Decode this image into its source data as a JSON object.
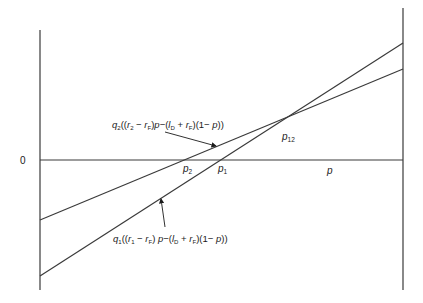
{
  "diagram": {
    "type": "line-diagram",
    "axes": {
      "origin_label": "0",
      "x_label": "p"
    },
    "lines": [
      {
        "id": "q2",
        "label": {
          "coef": "q",
          "coef_sub": "2",
          "open": "((",
          "r": "r",
          "r_sub": "2",
          "minus1": " − ",
          "rf": "r",
          "rf_sub": "F",
          "mid": ")",
          "p1": "p",
          "minus2": "−(",
          "l": "l",
          "l_sub": "D",
          "plus": " + ",
          "rf2": "r",
          "rf2_sub": "F",
          "tail_open": ")(1− ",
          "p2": "p",
          "close": "))"
        }
      },
      {
        "id": "q1",
        "label": {
          "coef": "q",
          "coef_sub": "1",
          "open": "((",
          "r": "r",
          "r_sub": "1",
          "minus1": " − ",
          "rf": "r",
          "rf_sub": "F",
          "mid": ") ",
          "p1": "p",
          "minus2": "−(",
          "l": "l",
          "l_sub": "D",
          "plus": " + ",
          "rf2": "r",
          "rf2_sub": "F",
          "tail_open": ")(1− ",
          "p2": "p",
          "close": "))"
        }
      }
    ],
    "points": {
      "p2": {
        "base": "p",
        "sub": "2"
      },
      "p1": {
        "base": "p",
        "sub": "1"
      },
      "p12": {
        "base": "p",
        "sub": "12"
      }
    },
    "colors": {
      "line": "#3a3a3a",
      "text": "#1a1a1a",
      "background": "#ffffff"
    }
  }
}
